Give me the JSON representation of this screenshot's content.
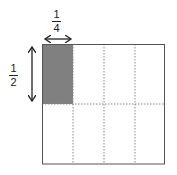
{
  "diagram": {
    "grid": {
      "columns": 4,
      "rows": 2
    },
    "shaded_cell": {
      "row": 0,
      "column": 0
    },
    "width_label": {
      "numerator": "1",
      "denominator": "4"
    },
    "height_label": {
      "numerator": "1",
      "denominator": "2"
    },
    "colors": {
      "shade": "#808080",
      "outline": "#555555",
      "dashed": "#888888"
    }
  }
}
